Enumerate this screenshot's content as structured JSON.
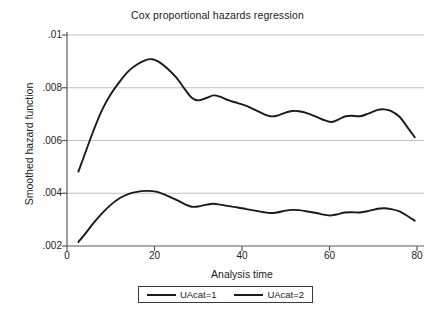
{
  "chart_data": {
    "type": "line",
    "title": "Cox proportional hazards regression",
    "xlabel": "Analysis time",
    "ylabel": "Smoothed hazard function",
    "xlim": [
      0,
      80
    ],
    "ylim": [
      0.002,
      0.01
    ],
    "xticks": [
      0,
      20,
      40,
      60,
      80
    ],
    "xtick_labels": [
      "0",
      "20",
      "40",
      "60",
      "80"
    ],
    "yticks": [
      0.002,
      0.004,
      0.006,
      0.008,
      0.01
    ],
    "ytick_labels": [
      ".002",
      ".004",
      ".006",
      ".008",
      ".01"
    ],
    "grid": "horizontal",
    "legend_position": "bottom-center",
    "series": [
      {
        "name": "UAcat=1",
        "color": "#1a1a1a",
        "x": [
          2.6,
          4,
          6,
          8,
          10,
          12,
          14,
          16,
          18,
          19.5,
          21,
          23,
          25,
          27,
          28.5,
          30,
          32,
          33.5,
          35,
          37,
          39,
          41,
          43,
          45,
          46.5,
          48,
          50,
          51.5,
          53,
          55,
          57,
          59,
          60.5,
          62,
          63.5,
          65,
          67,
          69,
          71,
          72.5,
          74,
          76,
          78,
          79.5
        ],
        "y": [
          0.00482,
          0.00545,
          0.00635,
          0.00715,
          0.00775,
          0.00822,
          0.00862,
          0.00888,
          0.00905,
          0.00908,
          0.00898,
          0.00872,
          0.00838,
          0.00793,
          0.00762,
          0.00752,
          0.00762,
          0.00771,
          0.00766,
          0.00752,
          0.00742,
          0.00731,
          0.00716,
          0.007,
          0.00692,
          0.00694,
          0.00706,
          0.00712,
          0.00711,
          0.00703,
          0.0069,
          0.00676,
          0.0067,
          0.00679,
          0.00691,
          0.00694,
          0.00692,
          0.00703,
          0.00716,
          0.00718,
          0.00712,
          0.0069,
          0.00646,
          0.00612
        ]
      },
      {
        "name": "UAcat=2",
        "color": "#1a1a1a",
        "x": [
          2.6,
          4,
          6,
          8,
          10,
          12,
          14,
          16,
          18,
          19.5,
          21,
          23,
          25,
          27,
          28.5,
          30,
          32,
          33.5,
          35,
          37,
          39,
          41,
          43,
          45,
          46.5,
          48,
          50,
          51.5,
          53,
          55,
          57,
          59,
          60.5,
          62,
          63.5,
          65,
          67,
          69,
          71,
          72.5,
          74,
          76,
          78,
          79.5
        ],
        "y": [
          0.00215,
          0.00243,
          0.00286,
          0.00324,
          0.00356,
          0.00381,
          0.00397,
          0.00405,
          0.00409,
          0.00408,
          0.00403,
          0.0039,
          0.00375,
          0.00358,
          0.00349,
          0.0035,
          0.00357,
          0.0036,
          0.00357,
          0.00351,
          0.00346,
          0.0034,
          0.00334,
          0.00328,
          0.00325,
          0.00327,
          0.00334,
          0.00337,
          0.00336,
          0.00331,
          0.00325,
          0.00318,
          0.00316,
          0.00321,
          0.00327,
          0.00328,
          0.00327,
          0.00333,
          0.00341,
          0.00343,
          0.0034,
          0.00331,
          0.00312,
          0.00296
        ]
      }
    ]
  },
  "legend": {
    "entries": [
      {
        "label": "UAcat=1"
      },
      {
        "label": "UAcat=2"
      }
    ]
  },
  "caption": {
    "text": ""
  }
}
